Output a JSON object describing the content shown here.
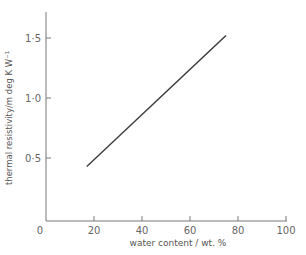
{
  "chart_data": {
    "type": "line",
    "title": "",
    "xlabel": "water content / wt. %",
    "ylabel": "thermal resistivity/m deg K W⁻¹",
    "xlim": [
      0,
      100
    ],
    "ylim": [
      0,
      1.75
    ],
    "x_ticks": [
      0,
      20,
      40,
      60,
      80,
      100
    ],
    "x_tick_labels": [
      "0",
      "20",
      "40",
      "60",
      "80",
      "100"
    ],
    "y_ticks": [
      0.5,
      1.0,
      1.5
    ],
    "y_tick_labels": [
      "0·5",
      "1·0",
      "1·5"
    ],
    "grid": false,
    "legend": null,
    "series": [
      {
        "name": "thermal resistivity",
        "x": [
          17,
          75
        ],
        "y": [
          0.43,
          1.52
        ]
      }
    ]
  },
  "colors": {
    "axis": "#6a6a6a",
    "line": "#3a3a3a",
    "text": "#555555"
  }
}
